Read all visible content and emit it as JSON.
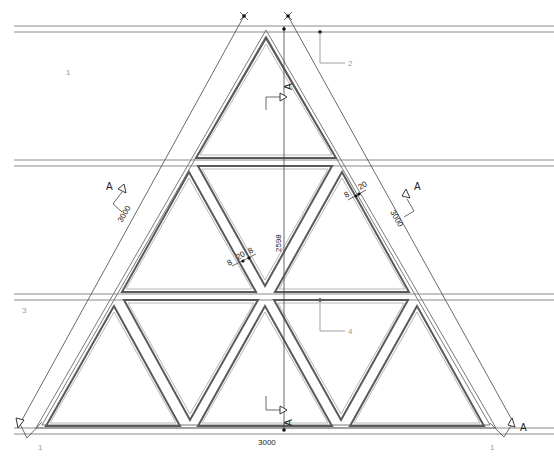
{
  "drawing": {
    "type": "architectural-elevation",
    "grid_lines": [
      {
        "label": "1",
        "y": 29
      },
      {
        "label": "2",
        "y": 29
      },
      {
        "label": "3",
        "y": 297
      },
      {
        "label": "4",
        "y": 297
      }
    ],
    "grid_label_1": "1",
    "grid_label_2": "2",
    "grid_label_3": "3",
    "grid_label_4": "4",
    "grid_label_bottom_left": "1",
    "grid_label_bottom_right": "1"
  },
  "dimensions": {
    "height": "2598",
    "base_width": "3000",
    "left_side": "3000",
    "right_side": "3000",
    "mullion_right_a": "8",
    "mullion_right_b": "20",
    "mullion_center_a": "8",
    "mullion_center_b": "20",
    "mullion_center_c": "8"
  },
  "section_markers": [
    {
      "id": "section-top",
      "label": "A"
    },
    {
      "id": "section-bottom",
      "label": "A"
    },
    {
      "id": "section-left",
      "label": "A"
    },
    {
      "id": "section-right",
      "label": "A"
    },
    {
      "id": "section-bottom-left",
      "label": "A"
    },
    {
      "id": "section-bottom-right",
      "label": "A"
    }
  ],
  "section_label": "A",
  "colors": {
    "background": "#ffffff",
    "frame": "#5a5a5a",
    "gridline": "#8a8a8a",
    "dimension": "#222222"
  }
}
